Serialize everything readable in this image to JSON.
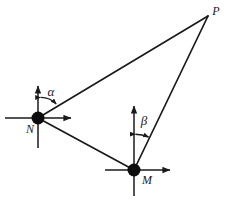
{
  "figure": {
    "name": "triangle-bearing-diagram",
    "background_color": "#ffffff",
    "stroke_color": "#1a1a1a"
  },
  "vertices": [
    {
      "id": "N",
      "label": "N",
      "x": 38,
      "y": 118,
      "label_x": 30,
      "label_y": 133,
      "marker": "filled-circle",
      "radius": 6.5
    },
    {
      "id": "M",
      "label": "M",
      "x": 134,
      "y": 170,
      "label_x": 147,
      "label_y": 184,
      "marker": "filled-circle",
      "radius": 6.5
    },
    {
      "id": "P",
      "label": "P",
      "x": 208,
      "y": 16,
      "label_x": 215,
      "label_y": 14,
      "marker": "none",
      "radius": 0
    }
  ],
  "edges": [
    {
      "id": "NP",
      "from": "N",
      "to": "P",
      "x1": 38,
      "y1": 118,
      "x2": 208,
      "y2": 16
    },
    {
      "id": "NM",
      "from": "N",
      "to": "M",
      "x1": 38,
      "y1": 118,
      "x2": 134,
      "y2": 170
    },
    {
      "id": "MP",
      "from": "M",
      "to": "P",
      "x1": 134,
      "y1": 170,
      "x2": 208,
      "y2": 16
    }
  ],
  "axes": [
    {
      "id": "N-vertical-axis",
      "node": "N",
      "orientation": "vertical",
      "x1": 38,
      "y1": 148,
      "x2": 38,
      "y2": 84,
      "arrow_at": "top"
    },
    {
      "id": "N-horizontal-axis",
      "node": "N",
      "orientation": "horizontal",
      "x1": 5,
      "y1": 118,
      "x2": 73,
      "y2": 118,
      "arrow_at": "right"
    },
    {
      "id": "M-vertical-axis",
      "node": "M",
      "orientation": "vertical",
      "x1": 134,
      "y1": 196,
      "x2": 134,
      "y2": 104,
      "arrow_at": "top"
    },
    {
      "id": "M-horizontal-axis",
      "node": "M",
      "orientation": "horizontal",
      "x1": 105,
      "y1": 170,
      "x2": 172,
      "y2": 170,
      "arrow_at": "right"
    }
  ],
  "angles": [
    {
      "id": "alpha",
      "label": "α",
      "at_node": "N",
      "from_ray": "N-vertical-axis",
      "to_ray": "NP",
      "label_x": 51,
      "label_y": 96,
      "arc_radius": 21,
      "arc_double_headed": true
    },
    {
      "id": "beta",
      "label": "β",
      "at_node": "M",
      "from_ray": "M-vertical-axis",
      "to_ray": "MP",
      "label_x": 144,
      "label_y": 125,
      "arc_radius": 36,
      "arc_double_headed": true
    }
  ]
}
